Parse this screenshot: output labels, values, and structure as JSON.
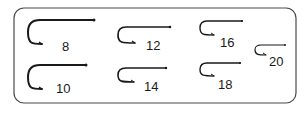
{
  "diagram": {
    "frame": {
      "x": 14,
      "y": 8,
      "w": 282,
      "h": 95,
      "radius": 10,
      "stroke": "#4a4a4a"
    },
    "hook_color": "#1a1a1a",
    "hooks": [
      {
        "size": "8",
        "shank_y": 20,
        "curve_x": 40,
        "eye_x": 94,
        "left_x": 28,
        "bottom_y": 44,
        "point_x": 42,
        "label_x": 62,
        "label_y": 51,
        "stroke": 2.0
      },
      {
        "size": "10",
        "shank_y": 65,
        "curve_x": 40,
        "eye_x": 86,
        "left_x": 28,
        "bottom_y": 89,
        "point_x": 42,
        "label_x": 56,
        "label_y": 93,
        "stroke": 2.0
      },
      {
        "size": "12",
        "shank_y": 27,
        "curve_x": 126,
        "eye_x": 170,
        "left_x": 118,
        "bottom_y": 43,
        "point_x": 135,
        "label_x": 146,
        "label_y": 50,
        "stroke": 1.7
      },
      {
        "size": "14",
        "shank_y": 68,
        "curve_x": 126,
        "eye_x": 166,
        "left_x": 118,
        "bottom_y": 82,
        "point_x": 134,
        "label_x": 144,
        "label_y": 91,
        "stroke": 1.6
      },
      {
        "size": "16",
        "shank_y": 21,
        "curve_x": 207,
        "eye_x": 242,
        "left_x": 200,
        "bottom_y": 35,
        "point_x": 214,
        "label_x": 220,
        "label_y": 47,
        "stroke": 1.4
      },
      {
        "size": "18",
        "shank_y": 63,
        "curve_x": 207,
        "eye_x": 240,
        "left_x": 200,
        "bottom_y": 76,
        "point_x": 214,
        "label_x": 218,
        "label_y": 89,
        "stroke": 1.4
      },
      {
        "size": "20",
        "shank_y": 45,
        "curve_x": 261,
        "eye_x": 285,
        "left_x": 255,
        "bottom_y": 55,
        "point_x": 266,
        "label_x": 269,
        "label_y": 66,
        "stroke": 1.2
      }
    ]
  }
}
